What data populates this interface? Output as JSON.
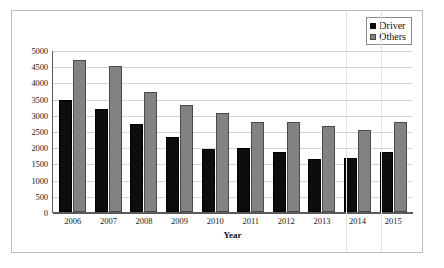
{
  "chart_data": {
    "type": "bar",
    "title": "",
    "xlabel": "Year",
    "ylabel": "Deaths",
    "categories": [
      "2006",
      "2007",
      "2008",
      "2009",
      "2010",
      "2011",
      "2012",
      "2013",
      "2014",
      "2015"
    ],
    "series": [
      {
        "name": "Driver",
        "color": "#0d0d0d",
        "values": [
          3450,
          3170,
          2720,
          2330,
          1940,
          1970,
          1840,
          1650,
          1680,
          1840
        ]
      },
      {
        "name": "Others",
        "color": "#828282",
        "values": [
          4700,
          4500,
          3700,
          3300,
          3050,
          2770,
          2770,
          2640,
          2520,
          2780
        ]
      }
    ],
    "ylim": [
      0,
      5000
    ],
    "yticks": [
      0,
      500,
      1000,
      1500,
      2000,
      2500,
      3000,
      3500,
      4000,
      4500,
      5000
    ],
    "ytick_labels": [
      "0",
      "500",
      "1000",
      "1500",
      "2000",
      "2500",
      "3000",
      "3500",
      "4000",
      "4500",
      "5000"
    ],
    "grid": true,
    "grid_axis": "y",
    "legend_position": "top-right",
    "legend_entries": [
      "Driver",
      "Others"
    ]
  }
}
